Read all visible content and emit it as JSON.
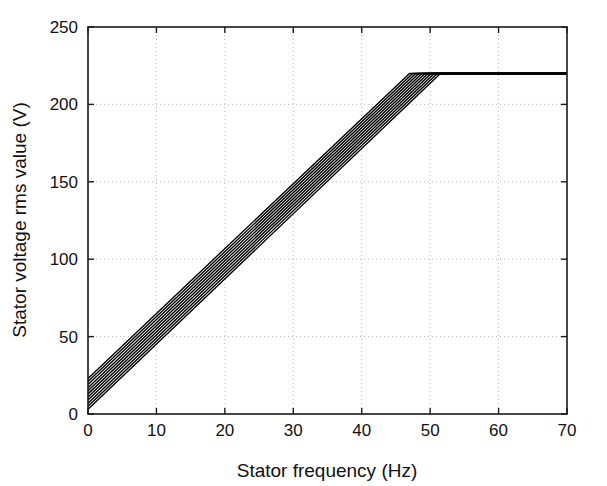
{
  "chart_data": {
    "type": "line",
    "title": "",
    "subtitle": "",
    "xlabel": "Stator frequency (Hz)",
    "ylabel": "Stator voltage rms value (V)",
    "xlim": [
      0,
      70
    ],
    "ylim": [
      0,
      250
    ],
    "xticks": [
      0,
      10,
      20,
      30,
      40,
      50,
      60,
      70
    ],
    "yticks": [
      0,
      50,
      100,
      150,
      200,
      250
    ],
    "xtick_labels": [
      "0",
      "10",
      "20",
      "30",
      "40",
      "50",
      "60",
      "70"
    ],
    "ytick_labels": [
      "0",
      "50",
      "100",
      "150",
      "200",
      "250"
    ],
    "grid": true,
    "grid_style": "dotted",
    "grid_color": "#b8b8b8",
    "axes_color": "#1a1a1a",
    "line_color": "#000000",
    "legend": false,
    "legend_position": "none",
    "annotations": [],
    "saturation_voltage": 220,
    "series": [
      {
        "name": "curve-1",
        "x": [
          0,
          47.0,
          70
        ],
        "y": [
          23.0,
          220,
          220
        ]
      },
      {
        "name": "curve-2",
        "x": [
          0,
          47.45,
          70
        ],
        "y": [
          21.0,
          220,
          220
        ]
      },
      {
        "name": "curve-3",
        "x": [
          0,
          47.9,
          70
        ],
        "y": [
          19.0,
          220,
          220
        ]
      },
      {
        "name": "curve-4",
        "x": [
          0,
          48.35,
          70
        ],
        "y": [
          17.0,
          220,
          220
        ]
      },
      {
        "name": "curve-5",
        "x": [
          0,
          48.8,
          70
        ],
        "y": [
          15.0,
          220,
          220
        ]
      },
      {
        "name": "curve-6",
        "x": [
          0,
          49.25,
          70
        ],
        "y": [
          13.0,
          220,
          220
        ]
      },
      {
        "name": "curve-7",
        "x": [
          0,
          49.7,
          70
        ],
        "y": [
          11.0,
          220,
          220
        ]
      },
      {
        "name": "curve-8",
        "x": [
          0,
          50.15,
          70
        ],
        "y": [
          9.0,
          220,
          220
        ]
      },
      {
        "name": "curve-9",
        "x": [
          0,
          50.6,
          70
        ],
        "y": [
          7.0,
          220,
          220
        ]
      },
      {
        "name": "curve-10",
        "x": [
          0,
          51.05,
          70
        ],
        "y": [
          5.0,
          220,
          220
        ]
      },
      {
        "name": "curve-11",
        "x": [
          0,
          51.5,
          70
        ],
        "y": [
          3.0,
          220,
          220
        ]
      }
    ]
  }
}
